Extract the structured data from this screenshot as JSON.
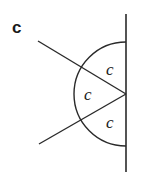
{
  "figure": {
    "panel_label": "c",
    "stroke_color": "#2a2a2a",
    "text_color": "#1a1a1a",
    "vertex": {
      "x": 126,
      "y": 94
    },
    "wall": {
      "x": 126,
      "y1": 14,
      "y2": 172
    },
    "rays": [
      {
        "name": "upper-ray",
        "x1": 38,
        "y1": 41,
        "x2": 126,
        "y2": 94
      },
      {
        "name": "lower-ray",
        "x1": 39,
        "y1": 144,
        "x2": 126,
        "y2": 94
      }
    ],
    "arc": {
      "cx": 126,
      "cy": 94,
      "r": 52
    },
    "angle_labels": [
      {
        "name": "top-angle",
        "text": "c",
        "x": 106,
        "y": 75
      },
      {
        "name": "middle-angle",
        "text": "c",
        "x": 84,
        "y": 100
      },
      {
        "name": "bottom-angle",
        "text": "c",
        "x": 106,
        "y": 128
      }
    ]
  }
}
